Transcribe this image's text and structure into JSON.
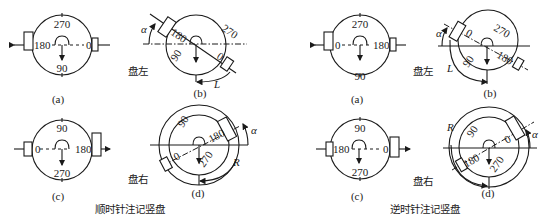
{
  "left_group": {
    "title": "顺时针注记竖盘",
    "face_left": "盘左",
    "face_right": "盘右",
    "a": {
      "caption": "(a)",
      "top": "270",
      "bottom": "90",
      "left": "180",
      "right": "0"
    },
    "b": {
      "caption": "(b)",
      "top": "270",
      "left": "180",
      "right": "0",
      "bottom": "90",
      "angle": "α",
      "arc": "L"
    },
    "c": {
      "caption": "(c)",
      "top": "90",
      "bottom": "270",
      "left": "0",
      "right": "180"
    },
    "d": {
      "caption": "(d)",
      "top": "90",
      "left": "0",
      "right": "180",
      "bottom": "270",
      "angle": "α",
      "arc": "R"
    }
  },
  "right_group": {
    "title": "逆时针注记竖盘",
    "face_left": "盘左",
    "face_right": "盘右",
    "a": {
      "caption": "(a)",
      "top": "270",
      "bottom": "90",
      "left": "0",
      "right": "180"
    },
    "b": {
      "caption": "(b)",
      "top": "270",
      "left": "0",
      "right": "180",
      "bottom": "90",
      "angle": "α",
      "arc": "L"
    },
    "c": {
      "caption": "(c)",
      "top": "90",
      "bottom": "270",
      "left": "180",
      "right": "0"
    },
    "d": {
      "caption": "(d)",
      "top": "90",
      "left": "180",
      "right": "0",
      "bottom": "270",
      "angle": "α",
      "arc": "R"
    }
  }
}
